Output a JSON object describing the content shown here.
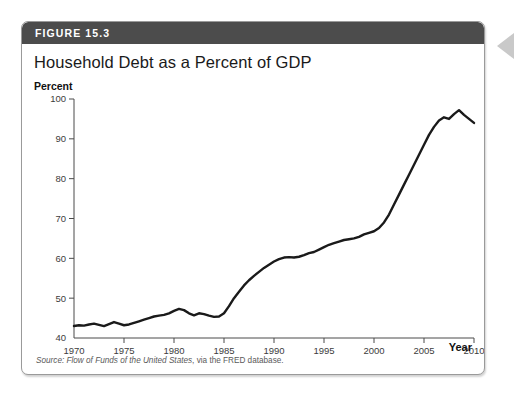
{
  "figure": {
    "number_label": "FIGURE 15.3",
    "title": "Household Debt as a Percent of GDP",
    "source_label": "Source:",
    "source_title": "Flow of Funds of the United States",
    "source_rest": ", via the FRED database.",
    "header_color": "#4c4c4c",
    "border_color": "#9a9a9a",
    "marker_color": "#c9c9c9"
  },
  "chart_data": {
    "type": "line",
    "title": "Household Debt as a Percent of GDP",
    "subtitle": "",
    "xlabel": "Year",
    "ylabel": "Percent",
    "xlim": [
      1970,
      2010
    ],
    "ylim": [
      40,
      100
    ],
    "x_ticks": [
      1970,
      1975,
      1980,
      1985,
      1990,
      1995,
      2000,
      2005,
      2010
    ],
    "y_ticks": [
      40,
      50,
      60,
      70,
      80,
      90,
      100
    ],
    "grid": false,
    "legend": "none",
    "line_color": "#1a1a1a",
    "series": [
      {
        "name": "Household Debt as a Percent of GDP",
        "x": [
          1970.0,
          1970.5,
          1971.0,
          1971.5,
          1972.0,
          1972.5,
          1973.0,
          1973.5,
          1974.0,
          1974.5,
          1975.0,
          1975.5,
          1976.0,
          1976.5,
          1977.0,
          1977.5,
          1978.0,
          1978.5,
          1979.0,
          1979.5,
          1980.0,
          1980.5,
          1981.0,
          1981.5,
          1982.0,
          1982.5,
          1983.0,
          1983.5,
          1984.0,
          1984.5,
          1985.0,
          1985.5,
          1986.0,
          1986.5,
          1987.0,
          1987.5,
          1988.0,
          1988.5,
          1989.0,
          1989.5,
          1990.0,
          1990.5,
          1991.0,
          1991.5,
          1992.0,
          1992.5,
          1993.0,
          1993.5,
          1994.0,
          1994.5,
          1995.0,
          1995.5,
          1996.0,
          1996.5,
          1997.0,
          1997.5,
          1998.0,
          1998.5,
          1999.0,
          1999.5,
          2000.0,
          2000.5,
          2001.0,
          2001.5,
          2002.0,
          2002.5,
          2003.0,
          2003.5,
          2004.0,
          2004.5,
          2005.0,
          2005.5,
          2006.0,
          2006.5,
          2007.0,
          2007.5,
          2008.0,
          2008.5,
          2009.0,
          2009.5,
          2010.0
        ],
        "y": [
          43.0,
          43.2,
          43.1,
          43.4,
          43.6,
          43.3,
          43.0,
          43.5,
          44.0,
          43.6,
          43.2,
          43.4,
          43.8,
          44.2,
          44.6,
          45.0,
          45.4,
          45.6,
          45.8,
          46.2,
          46.8,
          47.3,
          47.0,
          46.2,
          45.7,
          46.2,
          46.0,
          45.6,
          45.3,
          45.4,
          46.2,
          48.0,
          50.0,
          51.6,
          53.2,
          54.5,
          55.6,
          56.6,
          57.6,
          58.4,
          59.2,
          59.8,
          60.2,
          60.3,
          60.2,
          60.4,
          60.8,
          61.3,
          61.6,
          62.2,
          62.8,
          63.4,
          63.8,
          64.2,
          64.6,
          64.8,
          65.0,
          65.4,
          66.0,
          66.4,
          66.8,
          67.6,
          69.0,
          71.0,
          73.5,
          76.0,
          78.5,
          81.0,
          83.5,
          86.0,
          88.5,
          91.0,
          93.0,
          94.6,
          95.4,
          95.0,
          96.2,
          97.2,
          96.0,
          95.0,
          94.0
        ]
      }
    ],
    "peak": {
      "year": 2008.5,
      "value": 97.2
    },
    "end": {
      "year": 2010,
      "value": 94.0
    }
  }
}
